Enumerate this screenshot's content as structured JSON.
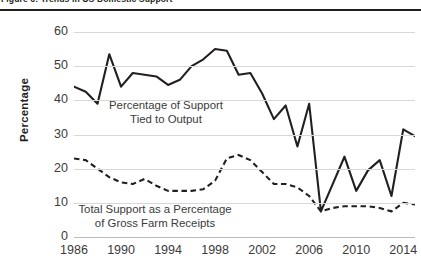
{
  "figure": {
    "title": "Figure 6: Trends in US Domestic Support"
  },
  "axes": {
    "ylabel": "Percentage",
    "yticks": [
      "0",
      "10",
      "20",
      "30",
      "40",
      "50",
      "60"
    ],
    "xticks": [
      "1986",
      "1990",
      "1994",
      "1998",
      "2002",
      "2006",
      "2010",
      "2014"
    ]
  },
  "annotations": {
    "output_line1": "Percentage of Support",
    "output_line2": "Tied to Output",
    "total_line1": "Total Support as a Percentage",
    "total_line2": "of Gross Farm Receipts"
  },
  "colors": {
    "line": "#231f20",
    "grid": "#d8d8d8",
    "text": "#3b3b3b",
    "background": "#ffffff"
  },
  "chart_data": {
    "type": "line",
    "title": "Figure 6: Trends in US Domestic Support",
    "xlabel": "",
    "ylabel": "Percentage",
    "ylim": [
      0,
      60
    ],
    "xlim": [
      1986,
      2015
    ],
    "grid": true,
    "legend": "inline-annotations",
    "x": [
      1986,
      1987,
      1988,
      1989,
      1990,
      1991,
      1992,
      1993,
      1994,
      1995,
      1996,
      1997,
      1998,
      1999,
      2000,
      2001,
      2002,
      2003,
      2004,
      2005,
      2006,
      2007,
      2008,
      2009,
      2010,
      2011,
      2012,
      2013,
      2014,
      2015
    ],
    "series": [
      {
        "name": "Percentage of Support Tied to Output",
        "style": "solid",
        "values": [
          44,
          42.5,
          39,
          53.5,
          44,
          48,
          47.5,
          47,
          44.5,
          46,
          50,
          52,
          55,
          54.5,
          47.5,
          48,
          42,
          34.5,
          38.5,
          26.5,
          39,
          7.5,
          15.5,
          23.5,
          13.5,
          19.5,
          22.5,
          12,
          31.5,
          29.5
        ]
      },
      {
        "name": "Total Support as a Percentage of Gross Farm Receipts",
        "style": "dashed",
        "values": [
          23,
          22.5,
          20,
          17.5,
          16,
          15.5,
          17,
          15,
          13.5,
          13.5,
          13.5,
          14,
          16.5,
          23,
          24,
          22.5,
          19,
          15.5,
          15.5,
          14.5,
          12,
          7.5,
          8.5,
          9,
          9,
          9,
          8.5,
          7.5,
          10,
          9.5
        ]
      }
    ]
  }
}
